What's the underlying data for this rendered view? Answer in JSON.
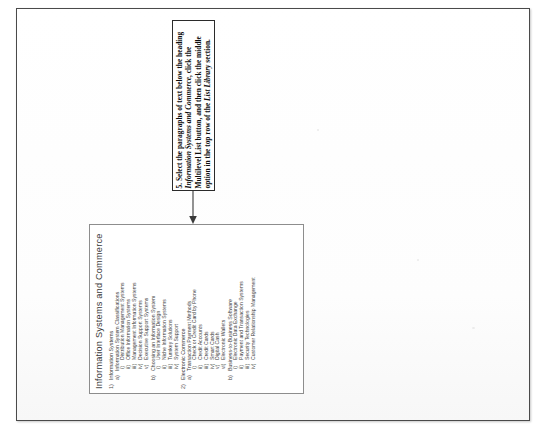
{
  "document": {
    "title": "Information Systems and Commerce",
    "outline": [
      {
        "level": 1,
        "marker": "1)",
        "text": "Information Systems"
      },
      {
        "level": 2,
        "marker": "a)",
        "text": "Information System Classifications"
      },
      {
        "level": 3,
        "marker": "i)",
        "text": "Distribution Management Systems"
      },
      {
        "level": 3,
        "marker": "ii)",
        "text": "Office Information Systems"
      },
      {
        "level": 3,
        "marker": "iii)",
        "text": "Management Information Systems"
      },
      {
        "level": 3,
        "marker": "iv)",
        "text": "Decision Support Systems"
      },
      {
        "level": 3,
        "marker": "v)",
        "text": "Executive Support Systems"
      },
      {
        "level": 2,
        "marker": "b)",
        "text": "Choosing an Information System"
      },
      {
        "level": 3,
        "marker": "i)",
        "text": "User Interface Design"
      },
      {
        "level": 3,
        "marker": "ii)",
        "text": "Niche Information Systems"
      },
      {
        "level": 3,
        "marker": "iii)",
        "text": "Turnkey Solutions"
      },
      {
        "level": 3,
        "marker": "iv)",
        "text": "System Support"
      },
      {
        "level": 1,
        "marker": "2)",
        "text": "Electronic Commerce"
      },
      {
        "level": 2,
        "marker": "a)",
        "text": "Transaction Payment Methods"
      },
      {
        "level": 3,
        "marker": "i)",
        "text": "Check or Credit Card by Phone"
      },
      {
        "level": 3,
        "marker": "ii)",
        "text": "Credit Accounts"
      },
      {
        "level": 3,
        "marker": "iii)",
        "text": "Credit Cards"
      },
      {
        "level": 3,
        "marker": "iv)",
        "text": "Smart Cards"
      },
      {
        "level": 3,
        "marker": "v)",
        "text": "Digital Cash"
      },
      {
        "level": 3,
        "marker": "vi)",
        "text": "Electronic Wallets"
      },
      {
        "level": 2,
        "marker": "b)",
        "text": "Business-to-Business Software"
      },
      {
        "level": 3,
        "marker": "i)",
        "text": "Electronic Data Exchange"
      },
      {
        "level": 3,
        "marker": "ii)",
        "text": "Payment and Transaction Systems"
      },
      {
        "level": 3,
        "marker": "iii)",
        "text": "Security Technologies"
      },
      {
        "level": 3,
        "marker": "iv)",
        "text": "Customer Relationship Management"
      }
    ]
  },
  "callout": {
    "step_number": "5.",
    "line_1": "Select the paragraphs of text below the heading",
    "emphasis_1": "Information Systems and Commerce",
    "line_2": ", click the",
    "line_3": "Multilevel List button, and then click the middle",
    "line_4": "option in the top row of the",
    "emphasis_2": "List Library",
    "line_5": "section.",
    "full_text": "5. Select the paragraphs of text below the heading Information Systems and Commerce, click the Multilevel List button, and then click the middle option in the top row of the List Library section.",
    "arrow_direction": "down"
  },
  "colors": {
    "page_border": "#4a4a4a",
    "content_border": "#8d8d8d",
    "callout_border": "#2b2b2b",
    "text": "#3d3d3d",
    "arrow": "#3a3a3a"
  }
}
